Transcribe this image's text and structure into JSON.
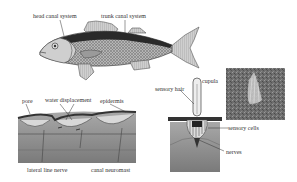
{
  "fish": {
    "labels": {
      "head_canal": "head canal system",
      "trunk_canal": "trunk canal system"
    }
  },
  "cross_section": {
    "labels": {
      "pore": "pore",
      "water_displacement": "water displacement",
      "epidermis": "epidermis",
      "lateral_line_nerve": "lateral line nerve",
      "canal_neuromast": "canal neuromast"
    }
  },
  "neuromast": {
    "labels": {
      "cupula": "cupula",
      "sensory_hair": "sensory hair",
      "sensory_cells": "sensory cells",
      "nerves": "nerves"
    }
  },
  "micrograph": {
    "description": "electron micrograph of cupula"
  },
  "colors": {
    "dark_band": "#2a2a2a",
    "body": "#9a9a9a",
    "fin": "#bdbdbd",
    "tissue": "#8c8c8c",
    "skin": "#d8d8d8"
  }
}
